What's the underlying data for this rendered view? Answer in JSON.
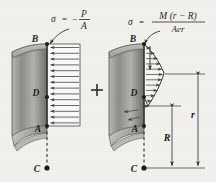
{
  "figure": {
    "background_color": "#f2f1ee",
    "ink_color": "#2b2b2b",
    "operator": "+"
  },
  "left_panel": {
    "name": "axial-stress-panel",
    "formula": {
      "sigma": "σ",
      "equals": "=",
      "minus": "−",
      "numerator": "P",
      "denominator": "A",
      "full": "σ = −P/A"
    },
    "points": [
      {
        "id": "B",
        "label": "B"
      },
      {
        "id": "D",
        "label": "D"
      },
      {
        "id": "A",
        "label": "A"
      },
      {
        "id": "C",
        "label": "C"
      }
    ],
    "distribution": {
      "type": "uniform",
      "arrow_count": 14,
      "arrow_direction": "left"
    }
  },
  "right_panel": {
    "name": "bending-stress-panel",
    "formula": {
      "sigma": "σ",
      "equals": "=",
      "numerator": "M (r − R)",
      "denominator": "Aer",
      "full": "σ = M(r − R)/(Aer)"
    },
    "points": [
      {
        "id": "B",
        "label": "B"
      },
      {
        "id": "D",
        "label": "D"
      },
      {
        "id": "A",
        "label": "A"
      },
      {
        "id": "C",
        "label": "C"
      }
    ],
    "distribution": {
      "type": "hyperbolic",
      "arrow_count": 12,
      "arrow_direction": "right"
    },
    "dimensions": [
      {
        "id": "R",
        "label": "R"
      },
      {
        "id": "r",
        "label": "r"
      }
    ]
  }
}
